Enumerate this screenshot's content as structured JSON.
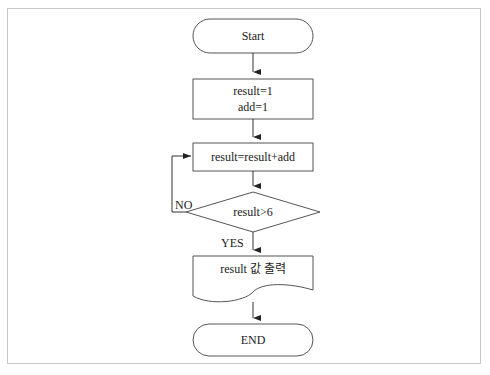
{
  "diagram": {
    "type": "flowchart",
    "nodes": {
      "start": {
        "shape": "terminator",
        "label": "Start"
      },
      "init": {
        "shape": "process",
        "lines": [
          "result=1",
          "add=1"
        ]
      },
      "update": {
        "shape": "process",
        "label": "result=result+add"
      },
      "condition": {
        "shape": "decision",
        "label": "result>6"
      },
      "output": {
        "shape": "document",
        "label": "result 값 출력"
      },
      "end": {
        "shape": "terminator",
        "label": "END"
      }
    },
    "edges": {
      "no_label": "NO",
      "yes_label": "YES"
    },
    "colors": {
      "stroke": "#555555",
      "frame": "#c8c8c8",
      "text": "#222222"
    }
  }
}
